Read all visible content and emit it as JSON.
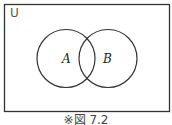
{
  "diagram": {
    "type": "venn",
    "universe_label": "U",
    "sets": [
      {
        "label": "A"
      },
      {
        "label": "B"
      }
    ],
    "caption": "※図 7.2",
    "stroke_color": "#333333"
  }
}
